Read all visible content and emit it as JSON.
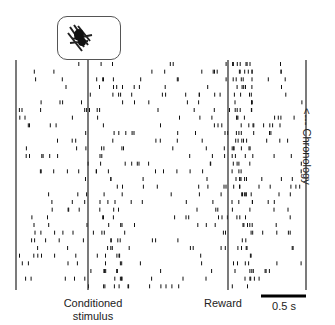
{
  "chart_data": {
    "type": "raster",
    "title": "",
    "xlabel": "",
    "ylabel": "<--- Chronology",
    "events": [
      {
        "name": "Conditioned stimulus",
        "x_px": 88
      },
      {
        "name": "Reward",
        "x_px": 228
      }
    ],
    "scale_bar": {
      "label": "0.5 s",
      "length_px": 45
    },
    "trials": 30
  },
  "labels": {
    "cs": "Conditioned\nstimulus",
    "reward": "Reward",
    "scale": "0.5 s",
    "chronology": "<--- Chronology"
  },
  "colors": {
    "ink": "#111111",
    "line": "#333333"
  },
  "layout": {
    "left": 16,
    "right": 306,
    "top": 60,
    "bottom": 290,
    "cs_x": 88,
    "reward_x": 228
  }
}
